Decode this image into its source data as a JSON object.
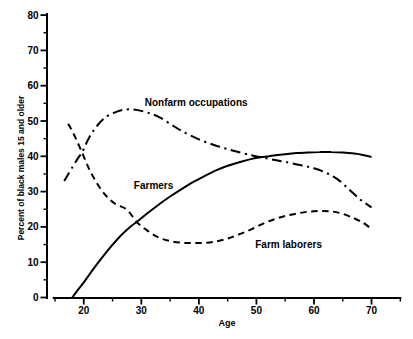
{
  "chart_data": {
    "type": "line",
    "title": "",
    "xlabel": "Age",
    "ylabel": "Percent of black males 15 and older",
    "xlim": [
      14.6,
      75.2
    ],
    "ylim": [
      0,
      80
    ],
    "x_ticks_major": [
      20,
      30,
      40,
      50,
      60,
      70
    ],
    "x_ticks_minor": [
      15,
      25,
      35,
      45,
      55,
      65,
      75
    ],
    "y_ticks_major": [
      0,
      10,
      20,
      30,
      40,
      50,
      60,
      70,
      80
    ],
    "y_ticks_minor": [
      5,
      15,
      25,
      35,
      45,
      55,
      65,
      75
    ],
    "grid": false,
    "legend_position": "inline-labels",
    "line_color": "#000000",
    "background_color": "#ffffff",
    "series": [
      {
        "name": "Nonfarm occupations",
        "line_style": "dash-dot",
        "label": {
          "text": "Nonfarm occupations",
          "age": 30.6,
          "pct": 54.2
        },
        "points": [
          [
            16.6,
            33
          ],
          [
            17.5,
            35.5
          ],
          [
            19,
            39.5
          ],
          [
            19.7,
            41.1
          ],
          [
            21,
            45.5
          ],
          [
            22.5,
            49
          ],
          [
            24,
            51.3
          ],
          [
            25.5,
            52.5
          ],
          [
            27,
            53.2
          ],
          [
            29,
            53.2
          ],
          [
            31,
            52.4
          ],
          [
            33,
            51.2
          ],
          [
            35,
            49.2
          ],
          [
            37,
            47.2
          ],
          [
            40,
            44.8
          ],
          [
            43,
            43
          ],
          [
            46,
            41.6
          ],
          [
            49,
            40.3
          ],
          [
            51,
            39.7
          ],
          [
            53,
            39
          ],
          [
            55,
            38.4
          ],
          [
            58,
            37.4
          ],
          [
            60,
            36.6
          ],
          [
            62,
            35.4
          ],
          [
            64,
            33.6
          ],
          [
            66,
            30.8
          ],
          [
            68,
            27.8
          ],
          [
            70,
            25.5
          ]
        ]
      },
      {
        "name": "Farmers",
        "line_style": "solid",
        "label": {
          "text": "Farmers",
          "age": 28.7,
          "pct": 30.7
        },
        "points": [
          [
            18,
            0
          ],
          [
            19,
            2.2
          ],
          [
            20,
            4.3
          ],
          [
            22,
            8.8
          ],
          [
            24,
            13
          ],
          [
            26,
            16.8
          ],
          [
            28,
            19.9
          ],
          [
            29.2,
            21.4
          ],
          [
            31,
            23.8
          ],
          [
            33,
            26.3
          ],
          [
            35,
            28.6
          ],
          [
            37,
            30.7
          ],
          [
            39,
            32.7
          ],
          [
            41,
            34.4
          ],
          [
            43,
            36
          ],
          [
            45,
            37.3
          ],
          [
            47,
            38.3
          ],
          [
            49,
            39.2
          ],
          [
            51,
            39.8
          ],
          [
            53,
            40.2
          ],
          [
            55,
            40.6
          ],
          [
            57,
            40.9
          ],
          [
            59,
            41.1
          ],
          [
            61,
            41.2
          ],
          [
            63,
            41.2
          ],
          [
            65,
            41.1
          ],
          [
            67,
            40.8
          ],
          [
            68.5,
            40.4
          ],
          [
            70,
            39.8
          ]
        ]
      },
      {
        "name": "Farm laborers",
        "line_style": "dashed",
        "label": {
          "text": "Farm laborers",
          "age": 49.8,
          "pct": 14.0
        },
        "points": [
          [
            17.3,
            49.2
          ],
          [
            18.2,
            46.5
          ],
          [
            19.7,
            41.1
          ],
          [
            21,
            36.2
          ],
          [
            22.5,
            31.8
          ],
          [
            24,
            28.6
          ],
          [
            25.5,
            26.5
          ],
          [
            27.5,
            24.9
          ],
          [
            29.2,
            21.4
          ],
          [
            31,
            19
          ],
          [
            33,
            17
          ],
          [
            35,
            16
          ],
          [
            37,
            15.5
          ],
          [
            39,
            15.4
          ],
          [
            41,
            15.5
          ],
          [
            43,
            15.9
          ],
          [
            45,
            16.7
          ],
          [
            47,
            17.9
          ],
          [
            49,
            19.2
          ],
          [
            51,
            20.8
          ],
          [
            53,
            22.1
          ],
          [
            55,
            23.1
          ],
          [
            57,
            23.8
          ],
          [
            59,
            24.3
          ],
          [
            61,
            24.5
          ],
          [
            63,
            24.4
          ],
          [
            65,
            23.7
          ],
          [
            67,
            22.4
          ],
          [
            68.5,
            21.2
          ],
          [
            70,
            19.4
          ]
        ]
      }
    ],
    "annotations_note": "curve names printed directly beside curves; no legend box"
  }
}
